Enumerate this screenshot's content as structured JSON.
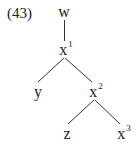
{
  "example_number": "(43)",
  "tree": {
    "nodes": {
      "w": {
        "base": "w",
        "sup": ""
      },
      "x1": {
        "base": "x",
        "sup": "1"
      },
      "y": {
        "base": "y",
        "sup": ""
      },
      "x2": {
        "base": "x",
        "sup": "2"
      },
      "z": {
        "base": "z",
        "sup": ""
      },
      "x3": {
        "base": "x",
        "sup": "3"
      }
    },
    "edges": [
      [
        "w",
        "x1"
      ],
      [
        "x1",
        "y"
      ],
      [
        "x1",
        "x2"
      ],
      [
        "x2",
        "z"
      ],
      [
        "x2",
        "x3"
      ]
    ]
  },
  "colors": {
    "line": "#333333",
    "text": "#222222"
  }
}
